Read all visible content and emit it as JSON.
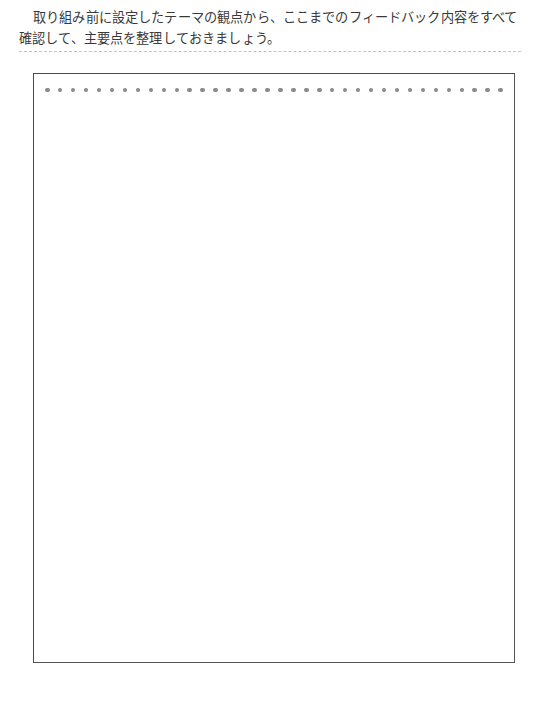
{
  "page": {
    "background_color": "#ffffff",
    "text_color": "#3a3a3a"
  },
  "instructions": {
    "line1": "取り組み前に設定したテーマの観点から、ここまでのフィードバック内容をすべて",
    "line2": "確認して、主要点を整理しておきましょう。"
  },
  "divider": {
    "style": "dashed",
    "color": "#c3c3c3"
  },
  "answer_box": {
    "border_color": "#4a4a4a",
    "fill_color": "#ffffff",
    "content": "",
    "placeholder": "",
    "dot_row": {
      "count": 36,
      "color": "#8a8a8a"
    }
  }
}
